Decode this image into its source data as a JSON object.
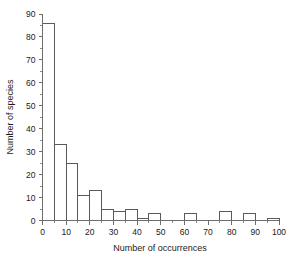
{
  "chart_data": {
    "type": "bar",
    "title": "",
    "subtitle": "",
    "xlabel": "Number of occurrences",
    "ylabel": "Number of species",
    "xlim": [
      0,
      100
    ],
    "ylim": [
      0,
      90
    ],
    "x_tick_labels": [
      "0",
      "10",
      "20",
      "30",
      "40",
      "50",
      "60",
      "70",
      "80",
      "90",
      "100"
    ],
    "x_ticks": [
      0,
      10,
      20,
      30,
      40,
      50,
      60,
      70,
      80,
      90,
      100
    ],
    "x_minor_ticks": [
      5,
      15,
      25,
      35,
      45,
      55,
      65,
      75,
      85,
      95
    ],
    "y_tick_labels": [
      "0",
      "10",
      "20",
      "30",
      "40",
      "50",
      "60",
      "70",
      "80",
      "90"
    ],
    "y_ticks": [
      0,
      10,
      20,
      30,
      40,
      50,
      60,
      70,
      80,
      90
    ],
    "y_minor_ticks": [
      5,
      15,
      25,
      35,
      45,
      55,
      65,
      75,
      85
    ],
    "bin_width": 5,
    "bin_edges": [
      0,
      5,
      10,
      15,
      20,
      25,
      30,
      35,
      40,
      45,
      50,
      55,
      60,
      65,
      70,
      75,
      80,
      85,
      90,
      95,
      100
    ],
    "categories": [
      "0-5",
      "5-10",
      "10-15",
      "15-20",
      "20-25",
      "25-30",
      "30-35",
      "35-40",
      "40-45",
      "45-50",
      "50-55",
      "55-60",
      "60-65",
      "65-70",
      "70-75",
      "75-80",
      "80-85",
      "85-90",
      "90-95",
      "95-100"
    ],
    "values": [
      86,
      33,
      25,
      11,
      13,
      5,
      4,
      5,
      1,
      3,
      0,
      0,
      3,
      0,
      0,
      4,
      0,
      3,
      0,
      1
    ],
    "grid": false,
    "legend": false,
    "legend_position": "none",
    "bar_fill_color": "#ffffff",
    "bar_edge_color": "#5a5a5a",
    "axis_color": "#6d6d6d",
    "background_color": "#ffffff"
  }
}
